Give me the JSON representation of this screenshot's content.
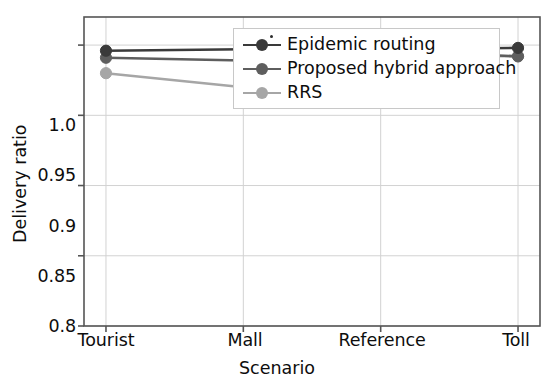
{
  "chart_data": {
    "type": "line",
    "title": "",
    "xlabel": "Scenario",
    "ylabel": "Delivery ratio",
    "categories": [
      "Tourist",
      "Mall",
      "Reference",
      "Toll"
    ],
    "xtick_labels": [
      "Tourist",
      "Mall",
      "Reference",
      "Toll"
    ],
    "ytick_labels": [
      "0.8",
      "0.85",
      "0.9",
      "0.95",
      "1.0"
    ],
    "ytick_values": [
      0.8,
      0.85,
      0.9,
      0.95,
      1.0
    ],
    "ylim": [
      0.8,
      1.02
    ],
    "xlim": [
      -0.16,
      3.16
    ],
    "grid": true,
    "grid_axis": "both",
    "legend_position": "upper center",
    "series": [
      {
        "name": "Epidemic routing",
        "color": "#3a3a3a",
        "marker": "circle",
        "values": [
          0.996,
          0.997,
          0.997,
          0.998
        ]
      },
      {
        "name": "Proposed hybrid approach",
        "color": "#5e5e5e",
        "marker": "circle",
        "values": [
          0.991,
          0.989,
          0.996,
          0.992
        ]
      },
      {
        "name": "RRS",
        "color": "#a6a6a6",
        "marker": "circle",
        "values": [
          0.98,
          0.97,
          0.993,
          0.992
        ]
      }
    ]
  },
  "axes": {
    "spine_color": "#555555",
    "grid_color": "#d2d2d2",
    "tick_color": "#555555",
    "background": "#ffffff"
  },
  "legend": {
    "entries": [
      "Epidemic routing",
      "Proposed hybrid approach",
      "RRS"
    ],
    "border_color": "#c8c8c8",
    "background": "#ffffff"
  }
}
